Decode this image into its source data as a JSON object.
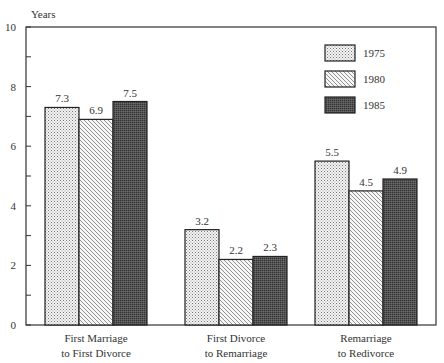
{
  "chart_data": {
    "type": "bar",
    "title": "",
    "ylabel": "Years",
    "xlabel": "",
    "ylim": [
      0,
      10
    ],
    "yticks_labeled": [
      0,
      2,
      4,
      6,
      8,
      10
    ],
    "yticks_minor": [
      1,
      3,
      5,
      7,
      9
    ],
    "grid": false,
    "legend_position": "upper right",
    "categories": [
      [
        "First Marriage",
        "to First Divorce"
      ],
      [
        "First Divorce",
        "to Remarriage"
      ],
      [
        "Remarriage",
        "to Redivorce"
      ]
    ],
    "series": [
      {
        "name": "1975",
        "pattern": "dots",
        "values": [
          7.3,
          3.2,
          5.5
        ]
      },
      {
        "name": "1980",
        "pattern": "diagonal-hatch",
        "values": [
          6.9,
          2.2,
          4.5
        ]
      },
      {
        "name": "1985",
        "pattern": "dark-crosshatch",
        "values": [
          7.5,
          2.3,
          4.9
        ]
      }
    ]
  }
}
